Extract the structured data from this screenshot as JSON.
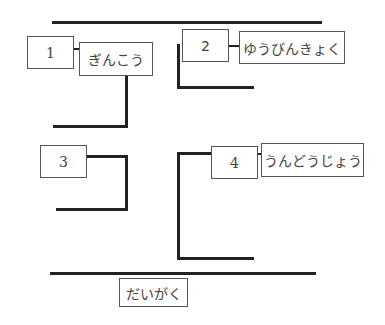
{
  "diagram": {
    "type": "street-map-labeling-exercise",
    "numbered_boxes": [
      {
        "id": "1",
        "label": "1"
      },
      {
        "id": "2",
        "label": "2"
      },
      {
        "id": "3",
        "label": "3"
      },
      {
        "id": "4",
        "label": "4"
      }
    ],
    "place_labels": {
      "box1": "ぎんこう",
      "box2": "ゆうびんきょく",
      "box4": "うんどうじょう",
      "bottom": "だいがく"
    },
    "colors": {
      "line": "#222222",
      "box_border": "#555555",
      "text": "#444444",
      "background": "#ffffff"
    }
  }
}
